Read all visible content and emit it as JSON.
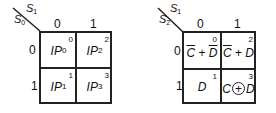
{
  "maps": [
    {
      "name": "input-map",
      "col_var": "S",
      "col_var_sub": "1",
      "row_var": "S",
      "row_var_sub": "0",
      "col_headers": [
        "0",
        "1"
      ],
      "row_headers": [
        "0",
        "1"
      ],
      "cells": [
        {
          "index": "0",
          "main": "IP",
          "sub": "0"
        },
        {
          "index": "2",
          "main": "IP",
          "sub": "2"
        },
        {
          "index": "1",
          "main": "IP",
          "sub": "1"
        },
        {
          "index": "3",
          "main": "IP",
          "sub": "3"
        }
      ]
    },
    {
      "name": "function-map",
      "col_var": "S",
      "col_var_sub": "1",
      "row_var": "S",
      "row_var_sub": "2",
      "col_headers": [
        "0",
        "1"
      ],
      "row_headers": [
        "0",
        "1"
      ],
      "cells": [
        {
          "index": "0",
          "expr": "C̄ + D̄",
          "a": "C",
          "op": "+",
          "b": "D",
          "a_bar": true,
          "b_bar": true
        },
        {
          "index": "2",
          "expr": "C̄ + D",
          "a": "C",
          "op": "+",
          "b": "D",
          "a_bar": true,
          "b_bar": false
        },
        {
          "index": "1",
          "expr": "D",
          "single": "D"
        },
        {
          "index": "3",
          "expr": "C ⊕ D",
          "a": "C",
          "op": "+",
          "b": "D",
          "xor": true
        }
      ]
    }
  ]
}
